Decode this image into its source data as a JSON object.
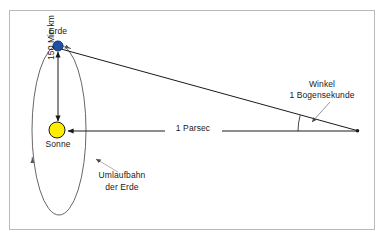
{
  "diagram": {
    "title_text": null,
    "labels": {
      "earth": "Erde",
      "sun": "Sonne",
      "distance": "150 Mio km",
      "parsec": "1 Parsec",
      "angle_line1": "Winkel",
      "angle_line2": "1 Bogensekunde",
      "orbit_line1": "Umlaufbahn",
      "orbit_line2": "der Erde"
    },
    "colors": {
      "earth": "#1f4fa8",
      "earth_stroke": "#16305f",
      "sun": "#ffee00",
      "sun_stroke": "#1a1a1a",
      "line": "#1a1a1a",
      "orbit": "#555555",
      "leader": "#9a9a9a",
      "frame": "#b9b9b9",
      "background": "#ffffff",
      "text": "#1a1a1a"
    },
    "geometry": {
      "earth_center": [
        58,
        46
      ],
      "earth_radius": 5,
      "sun_center": [
        57,
        130
      ],
      "sun_radius": 8,
      "orbit_center": [
        59,
        130
      ],
      "orbit_rx": 27,
      "orbit_ry": 85,
      "apex": [
        358,
        131
      ],
      "frame_rect": [
        9,
        10,
        366,
        220
      ]
    }
  }
}
